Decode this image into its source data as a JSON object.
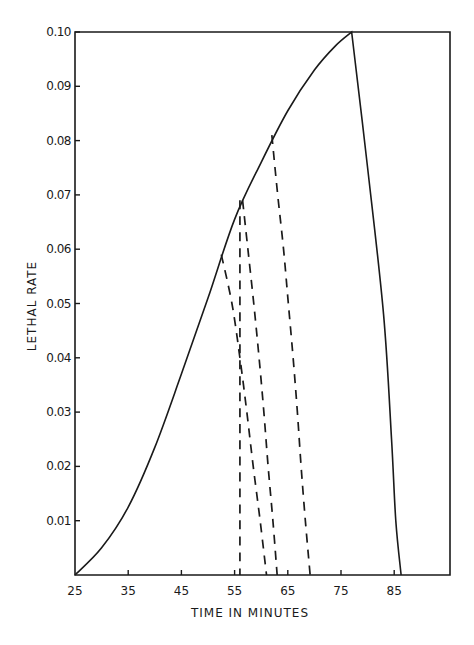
{
  "chart_data": {
    "type": "line",
    "title": "",
    "xlabel": "TIME IN MINUTES",
    "ylabel": "LETHAL RATE",
    "xlim": [
      25,
      92
    ],
    "ylim": [
      0,
      0.1
    ],
    "grid": false,
    "legend": null,
    "x_ticks": [
      "25",
      "35",
      "45",
      "55",
      "65",
      "75",
      "85"
    ],
    "y_ticks": [
      "0.01",
      "0.02",
      "0.03",
      "0.04",
      "0.05",
      "0.06",
      "0.07",
      "0.08",
      "0.09",
      "0.10"
    ],
    "series": [
      {
        "name": "heating-cooling curve",
        "style": "solid",
        "points": [
          [
            25,
            0.0
          ],
          [
            30,
            0.005
          ],
          [
            35,
            0.0125
          ],
          [
            40,
            0.0235
          ],
          [
            45,
            0.037
          ],
          [
            50,
            0.051
          ],
          [
            55,
            0.0655
          ],
          [
            60,
            0.076
          ],
          [
            65,
            0.0855
          ],
          [
            70,
            0.093
          ],
          [
            74,
            0.0975
          ],
          [
            77,
            0.1
          ],
          [
            80,
            0.075
          ],
          [
            83,
            0.048
          ],
          [
            84.5,
            0.025
          ],
          [
            85.3,
            0.01
          ],
          [
            86.3,
            0.0
          ]
        ]
      },
      {
        "name": "cooling from 53 min",
        "style": "dashed",
        "points": [
          [
            52.5,
            0.059
          ],
          [
            54.5,
            0.05
          ],
          [
            56,
            0.04
          ],
          [
            57.3,
            0.03
          ],
          [
            58.5,
            0.02
          ],
          [
            59.8,
            0.01
          ],
          [
            61,
            0.0
          ]
        ]
      },
      {
        "name": "cooling from 56 min (vertical)",
        "style": "dashed",
        "points": [
          [
            56,
            0.069
          ],
          [
            56,
            0.05
          ],
          [
            56,
            0.03
          ],
          [
            56,
            0.01
          ],
          [
            56,
            0.0
          ]
        ]
      },
      {
        "name": "cooling from 56.5 min",
        "style": "dashed",
        "points": [
          [
            56.5,
            0.069
          ],
          [
            57.5,
            0.06
          ],
          [
            58.6,
            0.05
          ],
          [
            59.6,
            0.04
          ],
          [
            60.5,
            0.03
          ],
          [
            61.3,
            0.02
          ],
          [
            62.2,
            0.01
          ],
          [
            63,
            0.0
          ]
        ]
      },
      {
        "name": "cooling from 62 min",
        "style": "dashed",
        "points": [
          [
            62,
            0.081
          ],
          [
            63.1,
            0.07
          ],
          [
            64.2,
            0.06
          ],
          [
            65.1,
            0.05
          ],
          [
            66,
            0.04
          ],
          [
            66.8,
            0.03
          ],
          [
            67.5,
            0.02
          ],
          [
            68.3,
            0.01
          ],
          [
            69.2,
            0.0
          ]
        ]
      }
    ]
  },
  "axes": {
    "x_label": "TIME IN MINUTES",
    "y_label": "LETHAL RATE",
    "x_ticks": [
      "25",
      "35",
      "45",
      "55",
      "65",
      "75",
      "85"
    ],
    "y_ticks": [
      "0.01",
      "0.02",
      "0.03",
      "0.04",
      "0.05",
      "0.06",
      "0.07",
      "0.08",
      "0.09",
      "0.10"
    ]
  },
  "colors": {
    "ink": "#1a1a1a",
    "background": "#ffffff"
  }
}
